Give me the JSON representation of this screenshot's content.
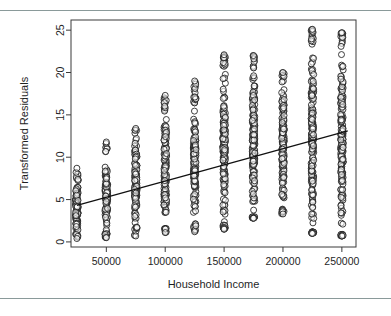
{
  "figure": {
    "name": "transformed-residuals-vs-household-income-scatter",
    "top_rule_color": "#8a9a9a",
    "bottom_rule_color": "#8a9a9a"
  },
  "chart_data": {
    "type": "scatter",
    "title": "",
    "xlabel": "Household Income",
    "ylabel": "Transformed Residuals",
    "xlim": [
      20000,
      262000
    ],
    "ylim": [
      -0.6,
      26.2
    ],
    "grid": false,
    "legend": null,
    "x_ticks": [
      50000,
      100000,
      150000,
      200000,
      250000
    ],
    "x_tick_labels": [
      "50000",
      "100000",
      "150000",
      "200000",
      "250000"
    ],
    "y_ticks": [
      0,
      5,
      10,
      15,
      20,
      25
    ],
    "y_tick_labels": [
      "0",
      "5",
      "10",
      "15",
      "20",
      "25"
    ],
    "marker": "open-circle",
    "marker_size_px": 6,
    "fit_line": {
      "type": "linear",
      "x0": 25000,
      "y0": 4.3,
      "x1": 255000,
      "y1": 13.1,
      "slope_per_100k": 3.83,
      "intercept": 3.34
    },
    "note": "Income is reported in discrete bracket midpoints, producing vertical columns of points.",
    "columns": [
      {
        "x": 25000,
        "n": 120,
        "y_min": 0.4,
        "y_max": 8.7,
        "y_dense_low": 1.0,
        "y_dense_high": 7.2
      },
      {
        "x": 50000,
        "n": 130,
        "y_min": 0.5,
        "y_max": 11.8,
        "y_dense_low": 1.0,
        "y_dense_high": 10.2
      },
      {
        "x": 75000,
        "n": 140,
        "y_min": 0.7,
        "y_max": 13.4,
        "y_dense_low": 1.9,
        "y_dense_high": 12.0
      },
      {
        "x": 100000,
        "n": 150,
        "y_min": 1.1,
        "y_max": 17.3,
        "y_dense_low": 1.6,
        "y_dense_high": 15.3
      },
      {
        "x": 125000,
        "n": 160,
        "y_min": 1.2,
        "y_max": 19.0,
        "y_dense_low": 2.2,
        "y_dense_high": 16.2
      },
      {
        "x": 150000,
        "n": 200,
        "y_min": 1.5,
        "y_max": 22.1,
        "y_dense_low": 2.0,
        "y_dense_high": 20.4
      },
      {
        "x": 175000,
        "n": 185,
        "y_min": 2.8,
        "y_max": 22.0,
        "y_dense_low": 3.0,
        "y_dense_high": 20.5
      },
      {
        "x": 200000,
        "n": 175,
        "y_min": 3.3,
        "y_max": 20.0,
        "y_dense_low": 3.8,
        "y_dense_high": 19.3
      },
      {
        "x": 225000,
        "n": 205,
        "y_min": 1.0,
        "y_max": 25.1,
        "y_dense_low": 1.2,
        "y_dense_high": 23.2
      },
      {
        "x": 250000,
        "n": 210,
        "y_min": 0.7,
        "y_max": 24.7,
        "y_dense_low": 0.9,
        "y_dense_high": 23.0
      }
    ]
  }
}
